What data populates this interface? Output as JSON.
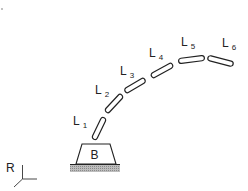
{
  "diagram": {
    "type": "serial-link manipulator / snake robot",
    "base": {
      "label": "B"
    },
    "reference_frame": {
      "label": "R"
    },
    "links": [
      {
        "id": "L1",
        "letter": "L",
        "index": "1",
        "x1": 94,
        "y1": 139,
        "x2": 104,
        "y2": 118,
        "label_x": 73,
        "label_y": 124
      },
      {
        "id": "L2",
        "letter": "L",
        "index": "2",
        "x1": 107,
        "y1": 111,
        "x2": 121,
        "y2": 96,
        "label_x": 95,
        "label_y": 93
      },
      {
        "id": "L3",
        "letter": "L",
        "index": "3",
        "x1": 126,
        "y1": 91,
        "x2": 144,
        "y2": 80,
        "label_x": 120,
        "label_y": 74
      },
      {
        "id": "L4",
        "letter": "L",
        "index": "4",
        "x1": 152,
        "y1": 76,
        "x2": 172,
        "y2": 65,
        "label_x": 149,
        "label_y": 57
      },
      {
        "id": "L5",
        "letter": "L",
        "index": "5",
        "x1": 180,
        "y1": 61,
        "x2": 203,
        "y2": 58,
        "label_x": 181,
        "label_y": 45
      },
      {
        "id": "L6",
        "letter": "L",
        "index": "6",
        "x1": 209,
        "y1": 58,
        "x2": 232,
        "y2": 64,
        "label_x": 222,
        "label_y": 47
      }
    ],
    "colors": {
      "stroke": "#222222",
      "hatch": "#9a9a9a",
      "background": "#ffffff"
    }
  }
}
